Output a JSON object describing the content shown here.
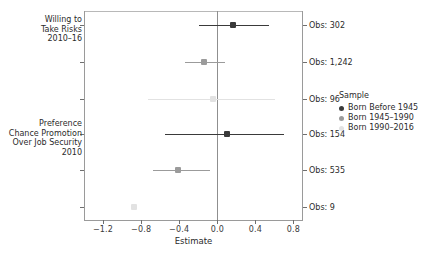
{
  "chart_data": {
    "type": "scatter",
    "title": "",
    "xlabel": "Estimate",
    "ylabel": "",
    "xlim": [
      -1.4,
      0.9
    ],
    "xticks": [
      -1.2,
      -0.8,
      -0.4,
      0.0,
      0.4,
      0.8
    ],
    "xticklabels": [
      "-1.2",
      "-0.8",
      "-0.4",
      "0.0",
      "0.4",
      "0.8"
    ],
    "grid": false,
    "zero_reference_line": 0.0,
    "legend_position": "right",
    "legend_title": "Sample",
    "series": [
      {
        "name": "Born Before 1945",
        "color": "#3a3a3a"
      },
      {
        "name": "Born 1945–1990",
        "color": "#9b9b9b"
      },
      {
        "name": "Born 1990–2016",
        "color": "#e2e2e2"
      }
    ],
    "outcome_groups": [
      {
        "label": "Willing to\nTake Risks\n2010–16"
      },
      {
        "label": "Preference\nChance Promotion\nOver Job Security\n2010"
      }
    ],
    "points": [
      {
        "group": 0,
        "series": "Born Before 1945",
        "estimate": 0.17,
        "ci_low": -0.19,
        "ci_high": 0.54,
        "obs_label": "Obs: 302",
        "obs": 302
      },
      {
        "group": 0,
        "series": "Born 1945–1990",
        "estimate": -0.14,
        "ci_low": -0.34,
        "ci_high": 0.08,
        "obs_label": "Obs: 1,242",
        "obs": 1242
      },
      {
        "group": 0,
        "series": "Born 1990–2016",
        "estimate": -0.05,
        "ci_low": -0.73,
        "ci_high": 0.61,
        "obs_label": "Obs: 96",
        "obs": 96
      },
      {
        "group": 1,
        "series": "Born Before 1945",
        "estimate": 0.1,
        "ci_low": -0.55,
        "ci_high": 0.7,
        "obs_label": "Obs: 154",
        "obs": 154
      },
      {
        "group": 1,
        "series": "Born 1945–1990",
        "estimate": -0.41,
        "ci_low": -0.68,
        "ci_high": -0.08,
        "obs_label": "Obs: 535",
        "obs": 535
      },
      {
        "group": 1,
        "series": "Born 1990–2016",
        "estimate": -0.87,
        "ci_low": null,
        "ci_high": null,
        "obs_label": "Obs: 9",
        "obs": 9
      }
    ]
  },
  "axis": {
    "x_title": "Estimate",
    "ticks": [
      "-1.2",
      "-0.8",
      "-0.4",
      "0.0",
      "0.4",
      "0.8"
    ]
  },
  "ylabels": {
    "group_0": "Willing to\nTake Risks\n2010–16",
    "group_1": "Preference\nChance Promotion\nOver Job Security\n2010"
  },
  "obs": {
    "r0": "Obs: 302",
    "r1": "Obs: 1,242",
    "r2": "Obs: 96",
    "r3": "Obs: 154",
    "r4": "Obs: 535",
    "r5": "Obs: 9"
  },
  "legend": {
    "title": "Sample",
    "items": [
      {
        "label": "Born Before 1945",
        "color": "#3a3a3a"
      },
      {
        "label": "Born 1945–1990",
        "color": "#9b9b9b"
      },
      {
        "label": "Born 1990–2016",
        "color": "#e2e2e2"
      }
    ]
  }
}
